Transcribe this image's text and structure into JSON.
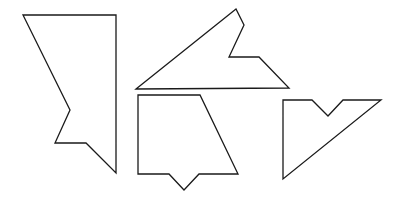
{
  "figure": {
    "width": 399,
    "height": 204,
    "stroke_color": "#1a1a1a",
    "background": "#ffffff",
    "shapes": [
      {
        "id": "shape-1",
        "points": "23,15 116,15 116,173 86,143 55,143 70,110"
      },
      {
        "id": "shape-2",
        "points": "136,89 236,9 244,25 229,57 259,57 289,88"
      },
      {
        "id": "shape-3",
        "points": "138,95 200,95 238,174 199,174 184,190 169,174 138,174"
      },
      {
        "id": "shape-4",
        "points": "283,100 312,100 328,116 343,100 381,100 283,179"
      }
    ]
  }
}
